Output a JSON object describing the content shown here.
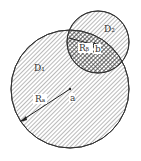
{
  "diagram": {
    "labels": {
      "d1": "D₁",
      "d2": "D₂",
      "ra": "Rₐ",
      "rb": "Rᵦ",
      "a": "a",
      "b": "b"
    },
    "circles": [
      {
        "name": "D1",
        "cx": 70,
        "cy": 89,
        "r": 59,
        "fill": "diagonal-hatch"
      },
      {
        "name": "D2",
        "cx": 98,
        "cy": 42,
        "r": 31,
        "fill": "diagonal-hatch"
      }
    ],
    "overlap_fill": "cross-hatch",
    "colors": {
      "stroke": "#333333",
      "hatch": "#555555",
      "background": "#ffffff"
    }
  }
}
